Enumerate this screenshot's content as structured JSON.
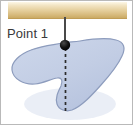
{
  "figure": {
    "background_color": "#ffffff",
    "width": 133,
    "height": 125
  },
  "ceiling": {
    "name": "ceiling-bar",
    "color_top": "#fdf6e4",
    "color_mid": "#e4cf9a",
    "color_bottom": "#caa95f",
    "x": 8,
    "y": 2,
    "width": 119,
    "height": 17
  },
  "rod": {
    "name": "suspension-rod",
    "color": "#4a4a4a",
    "x": 65,
    "y_top": 18,
    "y_bottom": 45,
    "width": 2
  },
  "pivot": {
    "name": "pivot-point",
    "label": "Point 1",
    "color": "#101010",
    "cx": 65,
    "cy": 45,
    "r": 5
  },
  "label": {
    "text": "Point 1",
    "x": 7,
    "y": 38,
    "color": "#3a3a3a",
    "font_size": 13
  },
  "plumb_line": {
    "name": "plumb-dashed-line",
    "color": "#2b2b2b",
    "x": 65,
    "y_top": 48,
    "y_bottom": 112,
    "dash": "3 3",
    "width": 1.6
  },
  "body": {
    "name": "rigid-body-blob",
    "fill": "#c3cee4",
    "stroke": "#8d9cbd",
    "stroke_width": 1.2,
    "shadow": "#e3e8f2",
    "path": "M 63 43 C 52 45 41 46 31 50 C 20 54 11 62 12 70 C 13 79 24 85 35 84 C 44 83 51 79 57 78 C 62 77 63 81 61 86 C 58 92 55 98 57 104 C 59 110 66 112 72 110 C 82 106 92 95 101 85 C 110 75 118 65 122 56 C 126 48 124 42 116 40 C 105 37 92 39 80 41 C 74 42 68 42 63 43 Z"
  },
  "colors": {
    "accent_blue": "#c3cee4",
    "accent_tan": "#e4cf9a",
    "ink": "#2b2b2b"
  }
}
